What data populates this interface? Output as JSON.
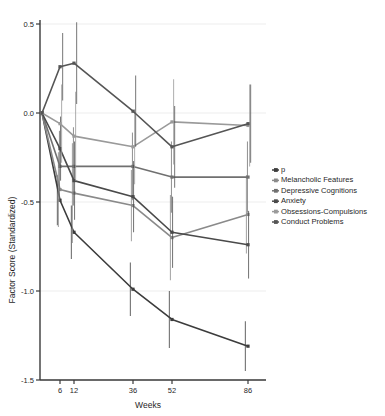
{
  "chart_data": {
    "type": "line",
    "title": "",
    "xlabel": "Weeks",
    "ylabel": "Factor Score (Standardized)",
    "x": [
      0,
      6,
      12,
      36,
      52,
      86
    ],
    "xtick_values": [
      6,
      12,
      36,
      52,
      86
    ],
    "xtick_labels": [
      "6",
      "12",
      "36",
      "52",
      "86"
    ],
    "ytick_values": [
      0.5,
      0.0,
      -0.5,
      -1.0,
      -1.5
    ],
    "ytick_labels": [
      "0.5",
      "0.0",
      "-0.5",
      "-1.0",
      "-1.5"
    ],
    "ylim": [
      -1.5,
      0.5
    ],
    "xlim": [
      0,
      92
    ],
    "grid": "horizontal",
    "legend_position": "right",
    "errorbars": true,
    "series": [
      {
        "name": "p",
        "color": "#3c3c3c",
        "values": [
          0.0,
          -0.49,
          -0.67,
          -0.99,
          -1.16,
          -1.31
        ],
        "err_low": [
          0.0,
          0.14,
          0.15,
          0.15,
          0.16,
          0.14
        ],
        "err_high": [
          0.0,
          0.14,
          0.15,
          0.15,
          0.16,
          0.14
        ]
      },
      {
        "name": "Melancholic Features",
        "color": "#8a8a8a",
        "values": [
          0.0,
          -0.43,
          -0.45,
          -0.52,
          -0.7,
          -0.57
        ],
        "err_low": [
          0.0,
          0.21,
          0.28,
          0.2,
          0.24,
          0.22
        ],
        "err_high": [
          0.0,
          0.21,
          0.28,
          0.2,
          0.24,
          0.22
        ]
      },
      {
        "name": "Depressive Cognitions",
        "color": "#707070",
        "values": [
          0.0,
          -0.3,
          -0.3,
          -0.3,
          -0.36,
          -0.36
        ],
        "err_low": [
          0.0,
          0.2,
          0.22,
          0.19,
          0.2,
          0.2
        ],
        "err_high": [
          0.0,
          0.2,
          0.22,
          0.19,
          0.2,
          0.2
        ]
      },
      {
        "name": "Anxiety",
        "color": "#4a4a4a",
        "values": [
          0.0,
          -0.2,
          -0.38,
          -0.47,
          -0.67,
          -0.74
        ],
        "err_low": [
          0.0,
          0.18,
          0.22,
          0.2,
          0.2,
          0.19
        ],
        "err_high": [
          0.0,
          0.18,
          0.22,
          0.2,
          0.2,
          0.19
        ]
      },
      {
        "name": "Obsessions-Compulsions",
        "color": "#9a9a9a",
        "values": [
          0.0,
          -0.06,
          -0.13,
          -0.19,
          -0.05,
          -0.07
        ],
        "err_low": [
          0.0,
          0.22,
          0.25,
          0.21,
          0.24,
          0.23
        ],
        "err_high": [
          0.0,
          0.22,
          0.25,
          0.21,
          0.24,
          0.23
        ]
      },
      {
        "name": "Conduct Problems",
        "color": "#555555",
        "values": [
          0.0,
          0.26,
          0.28,
          0.01,
          -0.19,
          -0.06
        ],
        "err_low": [
          0.0,
          0.19,
          0.23,
          0.2,
          0.23,
          0.22
        ],
        "err_high": [
          0.0,
          0.19,
          0.23,
          0.2,
          0.23,
          0.22
        ]
      }
    ]
  },
  "legend": {
    "entries": [
      {
        "label": "p"
      },
      {
        "label": "Melancholic Features"
      },
      {
        "label": "Depressive Cognitions"
      },
      {
        "label": "Anxiety"
      },
      {
        "label": "Obsessions-Compulsions"
      },
      {
        "label": "Conduct Problems"
      }
    ]
  },
  "axes": {
    "x_title": "Weeks",
    "y_title": "Factor Score (Standardized)"
  }
}
